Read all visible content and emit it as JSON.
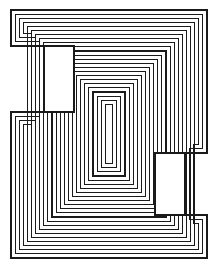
{
  "figure": {
    "title": "Nested rectilinear contour pattern",
    "style_name": "op-art concentric contour line drawing",
    "background_color": "#ffffff",
    "line_color": "#1a1a1a",
    "line_width_px": 1.05,
    "canvas": {
      "width": 222,
      "height": 272
    },
    "frame": {
      "x": 11,
      "y": 10,
      "width": 196,
      "height": 248
    },
    "contour_count": 24,
    "contour_spacing_px": 4.1,
    "islands": [
      {
        "name": "upper-left-island",
        "x": 44,
        "y": 46,
        "width": 30,
        "height": 66,
        "fill": "#ffffff"
      },
      {
        "name": "lower-right-island",
        "x": 155,
        "y": 153,
        "width": 30,
        "height": 62,
        "fill": "#ffffff"
      }
    ],
    "spine": {
      "name": "diagonal-step-spine",
      "description": "stepped zigzag ridge running from upper-right to lower-left through the centre",
      "step_count": 7
    }
  },
  "chart_data": {
    "type": "line",
    "title": "Nested rectilinear contour pattern",
    "xlabel": "",
    "ylabel": "",
    "xlim": [
      0,
      222
    ],
    "ylim": [
      0,
      272
    ],
    "grid": false,
    "legend": "none",
    "series": [
      {
        "name": "contour-00",
        "offset": 0
      },
      {
        "name": "contour-01",
        "offset": 4.1
      },
      {
        "name": "contour-02",
        "offset": 8.2
      },
      {
        "name": "contour-03",
        "offset": 12.3
      },
      {
        "name": "contour-04",
        "offset": 16.4
      },
      {
        "name": "contour-05",
        "offset": 20.5
      },
      {
        "name": "contour-06",
        "offset": 24.6
      },
      {
        "name": "contour-07",
        "offset": 28.7
      },
      {
        "name": "contour-08",
        "offset": 32.8
      },
      {
        "name": "contour-09",
        "offset": 36.9
      },
      {
        "name": "contour-10",
        "offset": 41.0
      },
      {
        "name": "contour-11",
        "offset": 45.1
      },
      {
        "name": "contour-12",
        "offset": 49.2
      },
      {
        "name": "contour-13",
        "offset": 53.3
      },
      {
        "name": "contour-14",
        "offset": 57.4
      },
      {
        "name": "contour-15",
        "offset": 61.5
      },
      {
        "name": "contour-16",
        "offset": 65.6
      },
      {
        "name": "contour-17",
        "offset": 69.7
      },
      {
        "name": "contour-18",
        "offset": 73.8
      },
      {
        "name": "contour-19",
        "offset": 77.9
      },
      {
        "name": "contour-20",
        "offset": 82.0
      },
      {
        "name": "contour-21",
        "offset": 86.1
      },
      {
        "name": "contour-22",
        "offset": 90.2
      },
      {
        "name": "contour-23",
        "offset": 94.3
      }
    ]
  }
}
